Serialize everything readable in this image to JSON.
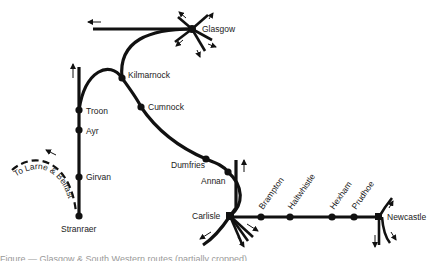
{
  "diagram": {
    "type": "railway-route-map",
    "colors": {
      "track": "#111111",
      "label": "#222222",
      "background": "#ffffff"
    },
    "stations": [
      {
        "id": "glasgow",
        "label": "Glasgow",
        "x": 192,
        "y": 29,
        "kind": "hub"
      },
      {
        "id": "kilmarnock",
        "label": "Kilmarnock",
        "x": 122,
        "y": 78,
        "kind": "station"
      },
      {
        "id": "cumnock",
        "label": "Cumnock",
        "x": 141,
        "y": 107,
        "kind": "station"
      },
      {
        "id": "troon",
        "label": "Troon",
        "x": 79,
        "y": 110,
        "kind": "station"
      },
      {
        "id": "ayr",
        "label": "Ayr",
        "x": 79,
        "y": 130,
        "kind": "station"
      },
      {
        "id": "girvan",
        "label": "Girvan",
        "x": 79,
        "y": 177,
        "kind": "station"
      },
      {
        "id": "stranraer",
        "label": "Stranraer",
        "x": 79,
        "y": 216,
        "kind": "station"
      },
      {
        "id": "dumfries",
        "label": "Dumfries",
        "x": 206,
        "y": 159,
        "kind": "station"
      },
      {
        "id": "annan",
        "label": "Annan",
        "x": 228,
        "y": 172,
        "kind": "station"
      },
      {
        "id": "carlisle",
        "label": "Carlisle",
        "x": 230,
        "y": 216,
        "kind": "hub"
      },
      {
        "id": "brampton",
        "label": "Brampton",
        "x": 261,
        "y": 217,
        "kind": "station"
      },
      {
        "id": "haltwhistle",
        "label": "Haltwhistle",
        "x": 290,
        "y": 217,
        "kind": "station"
      },
      {
        "id": "hexham",
        "label": "Hexham",
        "x": 332,
        "y": 217,
        "kind": "station"
      },
      {
        "id": "prudhoe",
        "label": "Prudhoe",
        "x": 354,
        "y": 217,
        "kind": "station"
      },
      {
        "id": "newcastle",
        "label": "Newcastle",
        "x": 379,
        "y": 217,
        "kind": "hub"
      }
    ],
    "branch_label": "To Larne & Belfast",
    "caption": "Figure — Glasgow & South Western routes (partially cropped)"
  }
}
